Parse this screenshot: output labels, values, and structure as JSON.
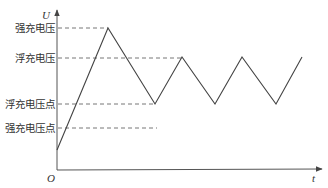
{
  "diagram": {
    "type": "voltage-time charging curve",
    "axes": {
      "y_label": "U",
      "x_label": "t",
      "origin_label": "O"
    },
    "levels": [
      {
        "id": "strong_charge_voltage",
        "label": "强充电压",
        "y": 28,
        "dash_end_x": 108
      },
      {
        "id": "float_charge_voltage",
        "label": "浮充电压",
        "y": 58,
        "dash_end_x": 182
      },
      {
        "id": "float_charge_voltage_point",
        "label": "浮充电压点",
        "y": 104,
        "dash_end_x": 155
      },
      {
        "id": "strong_charge_voltage_point",
        "label": "强充电压点",
        "y": 128,
        "dash_end_x": 157
      }
    ],
    "curve_points": [
      [
        57,
        150
      ],
      [
        108,
        28
      ],
      [
        155,
        104
      ],
      [
        182,
        57
      ],
      [
        215,
        104
      ],
      [
        242,
        57
      ],
      [
        276,
        104
      ],
      [
        302,
        57
      ]
    ],
    "colors": {
      "line": "#444444",
      "dash": "#666666",
      "text": "#333333",
      "background": "#ffffff"
    }
  }
}
